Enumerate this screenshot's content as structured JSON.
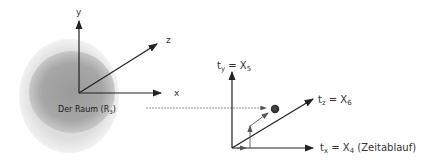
{
  "diagram": {
    "left": {
      "region_label": "Der Raum (R",
      "region_label_sub": "3",
      "region_label_close": ")",
      "axes": {
        "y": "y",
        "x": "x",
        "z": "z"
      }
    },
    "right": {
      "axes": {
        "ty": {
          "prefix": "t",
          "sub": "y",
          "eq": " = X",
          "idx": "5"
        },
        "tz": {
          "prefix": "t",
          "sub": "z",
          "eq": " = X",
          "idx": "6"
        },
        "tx": {
          "prefix": "t",
          "sub": "x",
          "eq": " = X",
          "idx": "4",
          "suffix": " (Zeitablauf)"
        }
      }
    },
    "colors": {
      "blob_outer": "#d9d9d9",
      "blob_inner": "#9a9a9a",
      "line": "#222222",
      "connector": "#777777",
      "dot": "#333333"
    }
  }
}
